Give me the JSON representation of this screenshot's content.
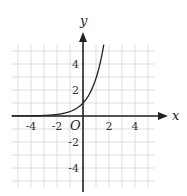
{
  "chart_data": {
    "type": "line",
    "title": "",
    "xlabel": "x",
    "ylabel": "y",
    "origin_label": "O",
    "xlim": [
      -5.5,
      5.5
    ],
    "ylim": [
      -5.5,
      5.5
    ],
    "grid": true,
    "grid_step": 1,
    "xticks": [
      -4,
      -2,
      2,
      4
    ],
    "yticks": [
      4,
      2,
      -2,
      -4
    ],
    "xtick_labels": [
      "-4",
      "-2",
      "2",
      "4"
    ],
    "ytick_labels": [
      "4",
      "2",
      "-2",
      "-4"
    ],
    "series": [
      {
        "name": "exponential curve",
        "x": [
          -5.5,
          -4,
          -3,
          -2,
          -1.5,
          -1,
          -0.5,
          0,
          0.5,
          1,
          1.3,
          1.6
        ],
        "y": [
          0.01,
          0.02,
          0.04,
          0.1,
          0.17,
          0.3,
          0.55,
          1.0,
          1.8,
          3.2,
          4.3,
          5.7
        ]
      }
    ]
  }
}
